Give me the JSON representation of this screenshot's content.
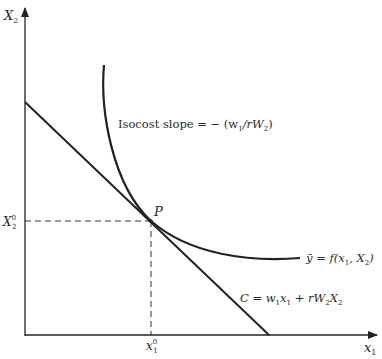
{
  "diagram": {
    "axes": {
      "y_label": "X",
      "y_label_sub": "2",
      "x_label": "x",
      "x_label_sub": "1"
    },
    "point": {
      "label": "P",
      "x_tick": "x",
      "x_tick_sub": "1",
      "x_tick_sup": "0",
      "y_tick": "X",
      "y_tick_sub": "2",
      "y_tick_sup": "0"
    },
    "annotations": {
      "slope_text": "Isocost slope = − (w",
      "slope_sub1": "1",
      "slope_mid": "/rW",
      "slope_sub2": "2",
      "slope_end": ")",
      "isoquant_label": "ȳ = f(x",
      "isoquant_sub1": "1",
      "isoquant_mid": ", X",
      "isoquant_sub2": "2",
      "isoquant_end": ")",
      "isocost_label": "C = w",
      "isocost_sub1": "1",
      "isocost_x": "x",
      "isocost_sub2": "1",
      "isocost_plus": " + rW",
      "isocost_sub3": "2",
      "isocost_X": "X",
      "isocost_sub4": "2"
    },
    "colors": {
      "ink": "#222222",
      "background": "#ffffff"
    }
  }
}
